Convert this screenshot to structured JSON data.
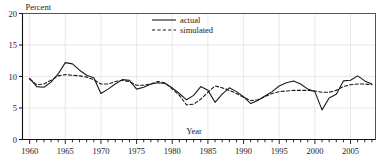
{
  "chart_data": {
    "type": "line",
    "title": "",
    "xlabel": "Year",
    "ylabel": "Percent",
    "xlim": [
      1959,
      2008.5
    ],
    "ylim": [
      0,
      20
    ],
    "yticks": [
      0,
      5,
      10,
      15,
      20
    ],
    "ytick_labels": [
      "0",
      "5",
      "10",
      "15",
      "20"
    ],
    "xticks": [
      1960,
      1965,
      1970,
      1975,
      1980,
      1985,
      1990,
      1995,
      2000,
      2005
    ],
    "xtick_labels": [
      "1960",
      "1965",
      "1970",
      "1975",
      "1980",
      "1985",
      "1990",
      "1995",
      "2000",
      "2005"
    ],
    "minor_xtick_interval": 1,
    "grid": "faint-both",
    "legend_position": "top-center",
    "x": [
      1960,
      1961,
      1962,
      1963,
      1964,
      1965,
      1966,
      1967,
      1968,
      1969,
      1970,
      1971,
      1972,
      1973,
      1974,
      1975,
      1976,
      1977,
      1978,
      1979,
      1980,
      1981,
      1982,
      1983,
      1984,
      1985,
      1986,
      1987,
      1988,
      1989,
      1990,
      1991,
      1992,
      1993,
      1994,
      1995,
      1996,
      1997,
      1998,
      1999,
      2000,
      2001,
      2002,
      2003,
      2004,
      2005,
      2006,
      2007,
      2008
    ],
    "series": [
      {
        "name": "actual",
        "style": "solid",
        "color": "#1a1a1a",
        "values": [
          9.7,
          8.4,
          8.3,
          9.1,
          10.4,
          12.2,
          12.0,
          11.0,
          10.2,
          9.8,
          7.3,
          8.0,
          8.8,
          9.5,
          9.4,
          8.0,
          8.3,
          8.8,
          9.0,
          8.9,
          8.2,
          7.3,
          6.3,
          7.0,
          8.4,
          7.8,
          5.9,
          7.2,
          8.2,
          7.6,
          6.8,
          5.7,
          6.2,
          6.9,
          7.6,
          8.5,
          9.0,
          9.3,
          8.8,
          8.0,
          7.6,
          4.7,
          6.6,
          7.2,
          9.3,
          9.4,
          10.1,
          9.3,
          8.8
        ]
      },
      {
        "name": "simulated",
        "style": "dashed",
        "color": "#1a1a1a",
        "values": [
          9.6,
          8.7,
          8.8,
          9.4,
          10.1,
          10.3,
          10.2,
          10.1,
          9.9,
          9.5,
          8.8,
          8.8,
          9.2,
          9.4,
          9.2,
          8.6,
          8.6,
          8.8,
          9.2,
          9.0,
          8.0,
          7.0,
          5.5,
          5.6,
          6.4,
          7.5,
          8.5,
          8.2,
          7.8,
          7.3,
          6.7,
          6.2,
          6.3,
          6.8,
          7.3,
          7.6,
          7.7,
          7.8,
          7.8,
          7.8,
          7.7,
          7.5,
          7.5,
          7.8,
          8.4,
          8.7,
          8.8,
          8.8,
          8.7
        ]
      }
    ]
  },
  "legend": {
    "entries": [
      {
        "label": "actual"
      },
      {
        "label": "simulated"
      }
    ]
  },
  "axes": {
    "y_axis_title": "Percent",
    "x_axis_title": "Year"
  }
}
